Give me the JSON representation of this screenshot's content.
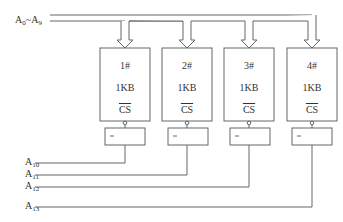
{
  "bus": {
    "label_main": "A",
    "sub_start": "0",
    "sep": "~",
    "label_end": "A",
    "sub_end": "9"
  },
  "chips": [
    {
      "id": "1#",
      "size": "1KB",
      "pin": "CS",
      "x": 100
    },
    {
      "id": "2#",
      "size": "1KB",
      "pin": "CS",
      "x": 162
    },
    {
      "id": "3#",
      "size": "1KB",
      "pin": "CS",
      "x": 224
    },
    {
      "id": "4#",
      "size": "1KB",
      "pin": "CS",
      "x": 287
    }
  ],
  "decoder_symbol": "—",
  "select_lines": [
    {
      "label": "A",
      "sub": "10",
      "y": 163
    },
    {
      "label": "A",
      "sub": "11",
      "y": 175
    },
    {
      "label": "A",
      "sub": "12",
      "y": 187
    },
    {
      "label": "A",
      "sub": "13",
      "y": 207
    }
  ],
  "colors": {
    "line": "#555555",
    "text": "#333333"
  }
}
